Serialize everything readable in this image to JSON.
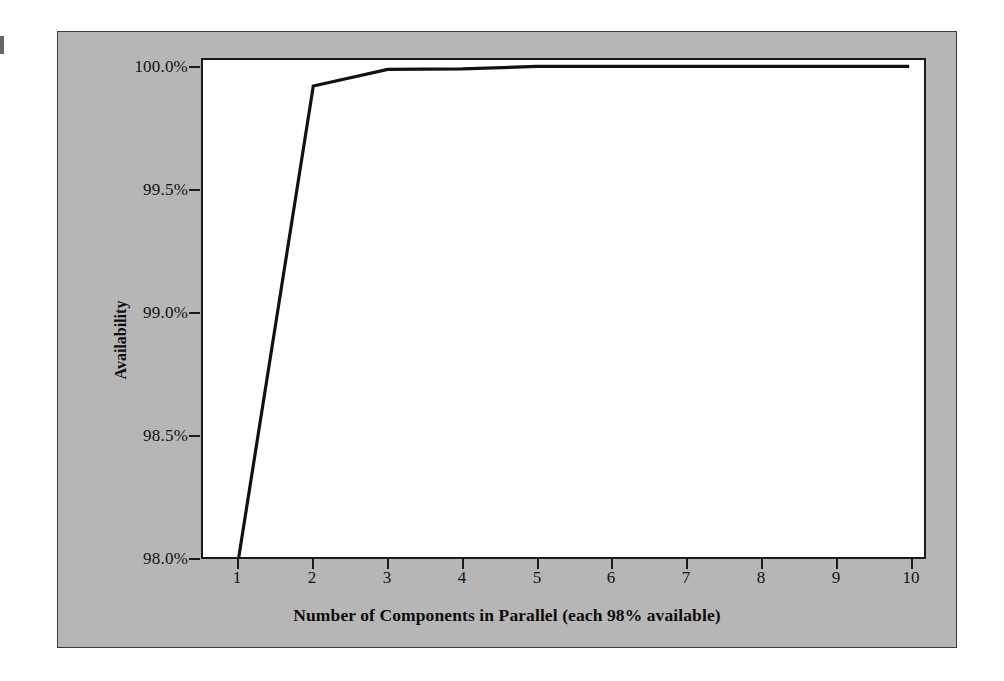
{
  "figure": {
    "background_color": "#b6b6b6",
    "plot_background_color": "#ffffff",
    "line_color": "#111111",
    "axis_color": "#1a1a1a"
  },
  "chart_data": {
    "type": "line",
    "title": "",
    "xlabel": "Number of Components in Parallel (each 98% available)",
    "ylabel": "Availability",
    "x": [
      1,
      2,
      3,
      4,
      5,
      6,
      7,
      8,
      9,
      10
    ],
    "xticklabels": [
      "1",
      "2",
      "3",
      "4",
      "5",
      "6",
      "7",
      "8",
      "9",
      "10"
    ],
    "yticklabels": [
      "98.0%",
      "98.5%",
      "99.0%",
      "99.5%",
      "100.0%"
    ],
    "ytickvalues": [
      98.0,
      98.5,
      99.0,
      99.5,
      100.0
    ],
    "xlim": [
      0.8,
      10.6
    ],
    "ylim": [
      98.0,
      100.08
    ],
    "grid": false,
    "legend": null,
    "series": [
      {
        "name": "Availability",
        "values": [
          98.0,
          99.96,
          99.9992,
          99.999984,
          100.0,
          100.0,
          100.0,
          100.0,
          100.0,
          100.0
        ],
        "plotted_values": [
          98.0,
          99.93,
          99.998,
          100.0,
          100.01,
          100.01,
          100.01,
          100.01,
          100.01,
          100.01
        ]
      }
    ]
  }
}
